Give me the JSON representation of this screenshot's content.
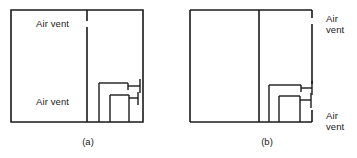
{
  "figure": {
    "type": "line-diagram",
    "stroke_color": "#1a1a1a",
    "background_color": "#ffffff"
  },
  "panels": [
    {
      "id": "a",
      "caption": "(a)",
      "labels": [
        {
          "id": "top",
          "text": "Air vent"
        },
        {
          "id": "bottom",
          "text": "Air vent"
        }
      ]
    },
    {
      "id": "b",
      "caption": "(b)",
      "labels": [
        {
          "id": "top",
          "text": "Air\nvent"
        },
        {
          "id": "bottom",
          "text": "Air\nvent"
        }
      ]
    }
  ]
}
